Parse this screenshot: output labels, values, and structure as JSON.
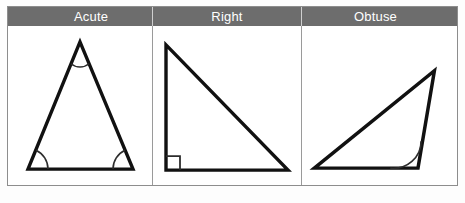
{
  "figure": {
    "colors": {
      "header_background": "#6d6d6d",
      "header_text": "#ffffff",
      "cell_background": "#ffffff",
      "border": "#8d8d8d",
      "stroke": "#111111",
      "page_background": "#fdfdfd"
    },
    "columns": [
      {
        "id": "acute",
        "label": "Acute",
        "shape_name": "acute-triangle",
        "marked_angles": 3,
        "angle_marker": "arc",
        "vertices": [
          {
            "x": 72,
            "y": 16
          },
          {
            "x": 20,
            "y": 144
          },
          {
            "x": 125,
            "y": 144
          }
        ]
      },
      {
        "id": "right",
        "label": "Right",
        "shape_name": "right-triangle",
        "marked_angles": 1,
        "angle_marker": "square",
        "vertices": [
          {
            "x": 13,
            "y": 19
          },
          {
            "x": 13,
            "y": 145
          },
          {
            "x": 135,
            "y": 145
          }
        ]
      },
      {
        "id": "obtuse",
        "label": "Obtuse",
        "shape_name": "obtuse-triangle",
        "marked_angles": 1,
        "angle_marker": "arc",
        "vertices": [
          {
            "x": 12,
            "y": 143
          },
          {
            "x": 129,
            "y": 45
          },
          {
            "x": 113,
            "y": 143
          }
        ]
      }
    ]
  }
}
